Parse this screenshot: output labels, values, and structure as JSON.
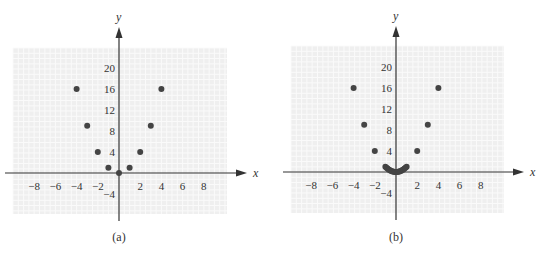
{
  "colors": {
    "grid_bg": "#efefef",
    "grid_line": "#fafafa",
    "axis": "#333333",
    "point": "#444444"
  },
  "chart_data": [
    {
      "type": "scatter",
      "caption": "(a)",
      "xlabel": "x",
      "ylabel": "y",
      "xlim": [
        -10,
        10
      ],
      "ylim": [
        -8,
        24
      ],
      "grid": true,
      "x_ticks": [
        -8,
        -6,
        -4,
        -2,
        2,
        4,
        6,
        8
      ],
      "x_tick_labels": [
        "−8",
        "−6",
        "−4",
        "−2",
        "2",
        "4",
        "6",
        "8"
      ],
      "y_ticks": [
        -4,
        4,
        8,
        12,
        16,
        20
      ],
      "y_tick_labels": [
        "−4",
        "4",
        "8",
        "12",
        "16",
        "20"
      ],
      "points": [
        {
          "x": -4,
          "y": 16
        },
        {
          "x": -3,
          "y": 9
        },
        {
          "x": -2,
          "y": 4
        },
        {
          "x": -1,
          "y": 1
        },
        {
          "x": 0,
          "y": 0
        },
        {
          "x": 1,
          "y": 1
        },
        {
          "x": 2,
          "y": 4
        },
        {
          "x": 3,
          "y": 9
        },
        {
          "x": 4,
          "y": 16
        }
      ]
    },
    {
      "type": "scatter",
      "caption": "(b)",
      "xlabel": "x",
      "ylabel": "y",
      "xlim": [
        -10,
        10
      ],
      "ylim": [
        -8,
        24
      ],
      "grid": true,
      "x_ticks": [
        -8,
        -6,
        -4,
        -2,
        2,
        4,
        6,
        8
      ],
      "x_tick_labels": [
        "−8",
        "−6",
        "−4",
        "−2",
        "2",
        "4",
        "6",
        "8"
      ],
      "y_ticks": [
        -4,
        4,
        8,
        12,
        16,
        20
      ],
      "y_tick_labels": [
        "−4",
        "4",
        "8",
        "12",
        "16",
        "20"
      ],
      "points": [
        {
          "x": -4,
          "y": 16
        },
        {
          "x": -3,
          "y": 9
        },
        {
          "x": -2,
          "y": 4
        },
        {
          "x": -1,
          "y": 1
        },
        {
          "x": -0.9,
          "y": 0.81
        },
        {
          "x": -0.8,
          "y": 0.64
        },
        {
          "x": -0.7,
          "y": 0.49
        },
        {
          "x": -0.6,
          "y": 0.36
        },
        {
          "x": -0.5,
          "y": 0.25
        },
        {
          "x": -0.4,
          "y": 0.16
        },
        {
          "x": -0.3,
          "y": 0.09
        },
        {
          "x": -0.2,
          "y": 0.04
        },
        {
          "x": -0.1,
          "y": 0.01
        },
        {
          "x": 0,
          "y": 0
        },
        {
          "x": 0.1,
          "y": 0.01
        },
        {
          "x": 0.2,
          "y": 0.04
        },
        {
          "x": 0.3,
          "y": 0.09
        },
        {
          "x": 0.4,
          "y": 0.16
        },
        {
          "x": 0.5,
          "y": 0.25
        },
        {
          "x": 0.6,
          "y": 0.36
        },
        {
          "x": 0.7,
          "y": 0.49
        },
        {
          "x": 0.8,
          "y": 0.64
        },
        {
          "x": 0.9,
          "y": 0.81
        },
        {
          "x": 1,
          "y": 1
        },
        {
          "x": 2,
          "y": 4
        },
        {
          "x": 3,
          "y": 9
        },
        {
          "x": 4,
          "y": 16
        }
      ]
    }
  ]
}
